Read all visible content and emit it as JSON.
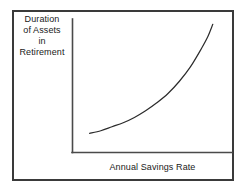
{
  "figure": {
    "background_color": "#ffffff",
    "border_color": "#3a3a3a",
    "axis_color": "#4a4a4a",
    "curve_color": "#2b2b2b",
    "text_color": "#1a1a1a"
  },
  "y_axis_label_lines": [
    "Duration",
    "of Assets",
    "in",
    "Retirement"
  ],
  "chart_data": {
    "type": "line",
    "title": "",
    "subtitle": "",
    "xlabel": "Annual Savings Rate",
    "ylabel": "Duration of Assets in Retirement",
    "grid": false,
    "legend": "none",
    "xticks": [],
    "yticks": [],
    "xtick_labels": [],
    "ytick_labels": [],
    "xlim": [
      0,
      1
    ],
    "ylim": [
      0,
      1
    ],
    "annotations": [],
    "series": [
      {
        "name": "Duration of assets vs savings rate",
        "shape": "convex-increasing-exponential",
        "x": [
          0.11,
          0.18,
          0.25,
          0.32,
          0.39,
          0.46,
          0.53,
          0.6,
          0.67,
          0.74,
          0.81,
          0.85,
          0.88
        ],
        "y": [
          0.14,
          0.16,
          0.19,
          0.22,
          0.26,
          0.31,
          0.37,
          0.44,
          0.53,
          0.64,
          0.78,
          0.87,
          0.96
        ]
      }
    ]
  }
}
